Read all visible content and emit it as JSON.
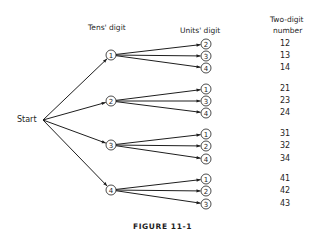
{
  "headers": {
    "tens": "Tens'  digit",
    "units": "Units'  digit",
    "result_line1": "Two-digit",
    "result_line2": "number"
  },
  "start_label": "Start",
  "caption": "FIGURE 11-1",
  "colors": {
    "ink": "#1e1e1e",
    "background": "#ffffff"
  },
  "tree": [
    {
      "tens": "1",
      "units": [
        "2",
        "3",
        "4"
      ],
      "numbers": [
        "12",
        "13",
        "14"
      ]
    },
    {
      "tens": "2",
      "units": [
        "1",
        "3",
        "4"
      ],
      "numbers": [
        "21",
        "23",
        "24"
      ]
    },
    {
      "tens": "3",
      "units": [
        "1",
        "2",
        "4"
      ],
      "numbers": [
        "31",
        "32",
        "34"
      ]
    },
    {
      "tens": "4",
      "units": [
        "1",
        "2",
        "3"
      ],
      "numbers": [
        "41",
        "42",
        "43"
      ]
    }
  ]
}
